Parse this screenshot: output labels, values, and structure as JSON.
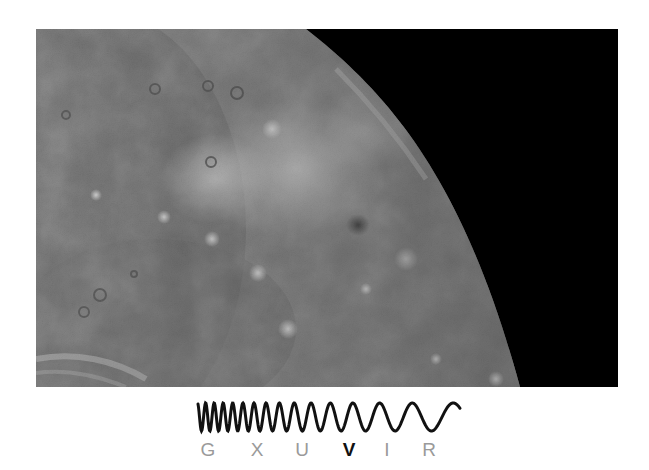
{
  "figure": {
    "photo_colors": {
      "space": "#000000",
      "surface_mid": "#7a7a7a",
      "surface_dark": "#555555",
      "surface_bright": "#d8d8d8"
    }
  },
  "spectrum": {
    "bands": [
      {
        "label": "G",
        "active": false
      },
      {
        "label": "X",
        "active": false
      },
      {
        "label": "U",
        "active": false
      },
      {
        "label": "V",
        "active": true
      },
      {
        "label": "I",
        "active": false
      },
      {
        "label": "R",
        "active": false
      }
    ],
    "inactive_color": "#9a9a9a",
    "active_color": "#111111",
    "wave_color": "#111111"
  }
}
